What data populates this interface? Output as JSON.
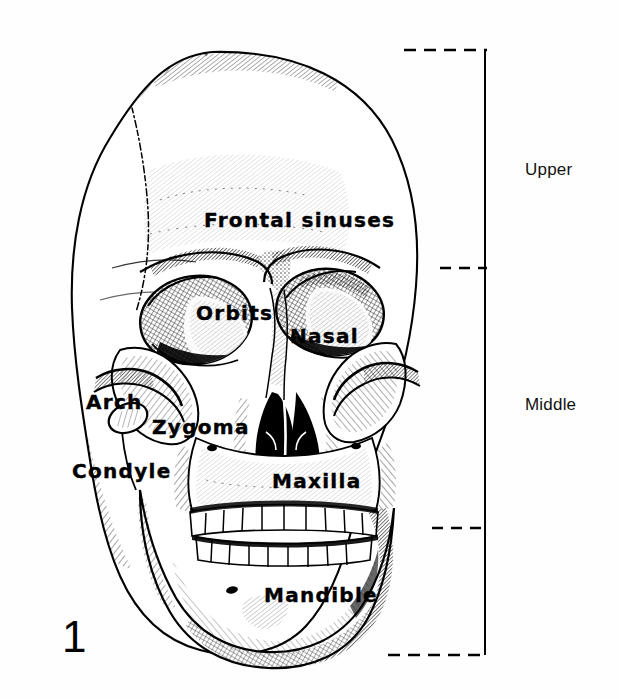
{
  "figure": {
    "number": "1",
    "caption_number": "1"
  },
  "anatomical_labels": [
    {
      "id": "frontal-sinuses",
      "text": "Frontal sinuses",
      "x": 204,
      "y": 210,
      "size": 20
    },
    {
      "id": "orbits",
      "text": "Orbits",
      "x": 196,
      "y": 303,
      "size": 20
    },
    {
      "id": "nasal",
      "text": "Nasal",
      "x": 290,
      "y": 326,
      "size": 20
    },
    {
      "id": "arch",
      "text": "Arch",
      "x": 86,
      "y": 392,
      "size": 20
    },
    {
      "id": "zygoma",
      "text": "Zygoma",
      "x": 152,
      "y": 417,
      "size": 20
    },
    {
      "id": "condyle",
      "text": "Condyle",
      "x": 72,
      "y": 461,
      "size": 20
    },
    {
      "id": "maxilla",
      "text": "Maxilla",
      "x": 272,
      "y": 471,
      "size": 20
    },
    {
      "id": "mandible",
      "text": "Mandible",
      "x": 264,
      "y": 585,
      "size": 20
    }
  ],
  "region_labels": [
    {
      "id": "upper",
      "text": "Upper",
      "x": 525,
      "y": 160
    },
    {
      "id": "middle",
      "text": "Middle",
      "x": 525,
      "y": 395
    }
  ],
  "bracket": {
    "line_x": 485,
    "line_top": 50,
    "line_bottom": 655,
    "dividers": [
      {
        "id": "divider-top",
        "y": 50,
        "x_start": 404,
        "x_end": 487
      },
      {
        "id": "divider-upper-middle",
        "y": 268,
        "x_start": 440,
        "x_end": 487
      },
      {
        "id": "divider-middle-lower",
        "y": 528,
        "x_start": 432,
        "x_end": 487
      },
      {
        "id": "divider-bottom",
        "y": 655,
        "x_start": 388,
        "x_end": 487
      }
    ],
    "color": "#000000"
  },
  "illustration": {
    "subject": "human-skull-anterior-view",
    "style": "pen-and-ink cross-hatched engraving",
    "ink_color": "#000000",
    "paper_color": "#ffffff"
  }
}
